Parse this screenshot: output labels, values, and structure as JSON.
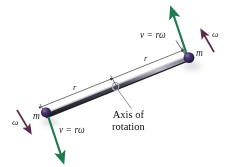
{
  "figure": {
    "background_color": "#ffffff"
  },
  "colors": {
    "rod": "#2a2a33",
    "rod_highlight": "#9a9aa6",
    "mass": "#3a2a5e",
    "velocity_arrow": "#1f7a4d",
    "omega_arrow": "#5a2a4a",
    "dimension_line": "#3c3c44",
    "leader_line": "#6a6a72",
    "text": "#1c1c22"
  },
  "labels": {
    "velocity_top": "v = rω",
    "velocity_bottom": "v = rω",
    "mass_top": "m",
    "mass_bottom": "m",
    "omega_top": "ω",
    "omega_bottom": "ω",
    "radius_left": "r",
    "radius_right": "r",
    "axis_line1": "Axis of",
    "axis_line2": "rotation"
  },
  "geometry": {
    "rod_left_x": 44,
    "rod_left_y": 112,
    "rod_right_x": 186,
    "rod_right_y": 55,
    "axis_center_x": 115,
    "axis_center_y": 83
  }
}
